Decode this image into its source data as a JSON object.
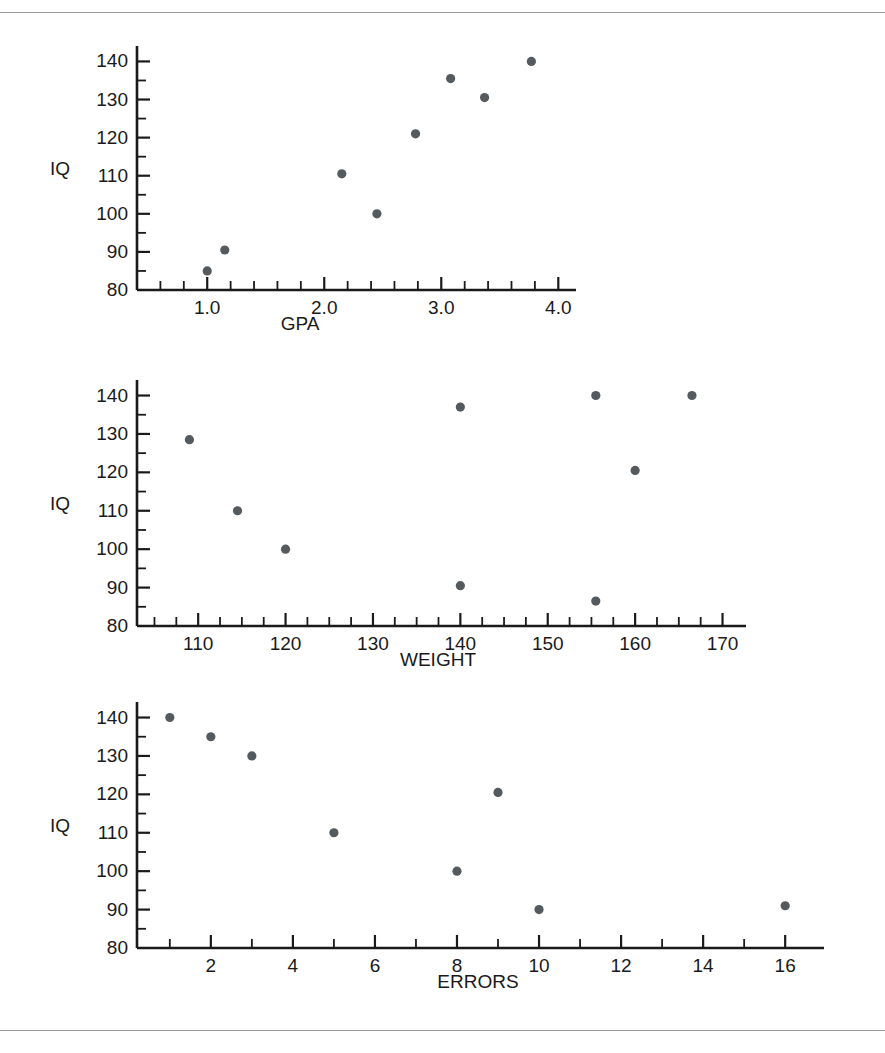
{
  "figure": {
    "background": "#ffffff",
    "rule_color": "#9a9a9a",
    "dot_color": "#555a5e",
    "axis_color": "#1a1a1a"
  },
  "chart_data": [
    {
      "type": "scatter",
      "name": "iq-vs-gpa",
      "title": "",
      "xlabel": "GPA",
      "ylabel": "IQ",
      "xlim": [
        0.4,
        4.1
      ],
      "ylim": [
        80,
        143
      ],
      "grid": false,
      "legend": "none",
      "x_ticks": [
        1.0,
        2.0,
        3.0,
        4.0
      ],
      "x_tick_labels": [
        "1.0",
        "2.0",
        "3.0",
        "4.0"
      ],
      "x_minor_step": 0.2,
      "y_ticks": [
        80,
        90,
        100,
        110,
        120,
        130,
        140
      ],
      "y_tick_labels": [
        "80",
        "90",
        "100",
        "110",
        "120",
        "130",
        "140"
      ],
      "y_minor_step": 5,
      "points": [
        {
          "x": 1.0,
          "y": 85
        },
        {
          "x": 1.15,
          "y": 90.5
        },
        {
          "x": 2.15,
          "y": 110.5
        },
        {
          "x": 2.45,
          "y": 100
        },
        {
          "x": 2.78,
          "y": 121
        },
        {
          "x": 3.08,
          "y": 135.5
        },
        {
          "x": 3.37,
          "y": 130.5
        },
        {
          "x": 3.77,
          "y": 140
        }
      ]
    },
    {
      "type": "scatter",
      "name": "iq-vs-weight",
      "title": "",
      "xlabel": "WEIGHT",
      "ylabel": "IQ",
      "xlim": [
        103,
        172
      ],
      "ylim": [
        80,
        143
      ],
      "grid": false,
      "legend": "none",
      "x_ticks": [
        110,
        120,
        130,
        140,
        150,
        160,
        170
      ],
      "x_tick_labels": [
        "110",
        "120",
        "130",
        "140",
        "150",
        "160",
        "170"
      ],
      "x_minor_step": 2.5,
      "y_ticks": [
        80,
        90,
        100,
        110,
        120,
        130,
        140
      ],
      "y_tick_labels": [
        "80",
        "90",
        "100",
        "110",
        "120",
        "130",
        "140"
      ],
      "y_minor_step": 5,
      "points": [
        {
          "x": 109,
          "y": 128.5
        },
        {
          "x": 114.5,
          "y": 110
        },
        {
          "x": 120,
          "y": 100
        },
        {
          "x": 140,
          "y": 137
        },
        {
          "x": 140,
          "y": 90.5
        },
        {
          "x": 155.5,
          "y": 140
        },
        {
          "x": 155.5,
          "y": 86.5
        },
        {
          "x": 160,
          "y": 120.5
        },
        {
          "x": 166.5,
          "y": 140
        }
      ]
    },
    {
      "type": "scatter",
      "name": "iq-vs-errors",
      "title": "",
      "xlabel": "ERRORS",
      "ylabel": "IQ",
      "xlim": [
        0.2,
        16.8
      ],
      "ylim": [
        80,
        143
      ],
      "grid": false,
      "legend": "none",
      "x_ticks": [
        2,
        4,
        6,
        8,
        10,
        12,
        14,
        16
      ],
      "x_tick_labels": [
        "2",
        "4",
        "6",
        "8",
        "10",
        "12",
        "14",
        "16"
      ],
      "x_minor_step": 1,
      "y_ticks": [
        80,
        90,
        100,
        110,
        120,
        130,
        140
      ],
      "y_tick_labels": [
        "80",
        "90",
        "100",
        "110",
        "120",
        "130",
        "140"
      ],
      "y_minor_step": 5,
      "points": [
        {
          "x": 1,
          "y": 140
        },
        {
          "x": 2,
          "y": 135
        },
        {
          "x": 3,
          "y": 130
        },
        {
          "x": 5,
          "y": 110
        },
        {
          "x": 8,
          "y": 100
        },
        {
          "x": 9,
          "y": 120.5
        },
        {
          "x": 10,
          "y": 90
        },
        {
          "x": 16,
          "y": 91
        }
      ]
    }
  ]
}
